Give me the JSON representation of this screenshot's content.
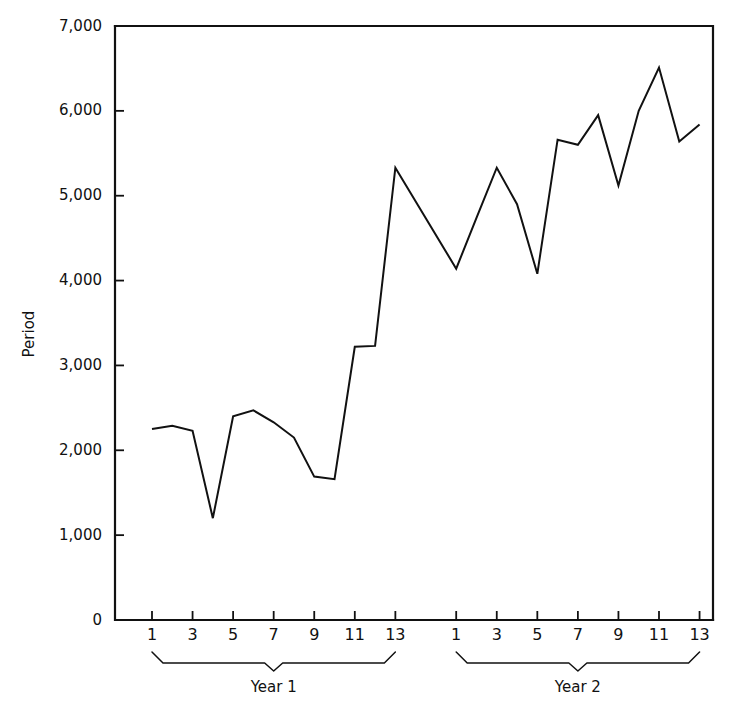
{
  "chart_data": {
    "type": "line",
    "title": "",
    "xlabel": "",
    "ylabel": "Period",
    "ylim": [
      0,
      7000
    ],
    "ytick_labels": [
      "7,000",
      "6,000",
      "5,000",
      "4,000",
      "3,000",
      "2,000",
      "1,000",
      "0"
    ],
    "ytick_values": [
      7000,
      6000,
      5000,
      4000,
      3000,
      2000,
      1000,
      0
    ],
    "grid": false,
    "legend": "none",
    "xtick_labels": [
      "1",
      "3",
      "5",
      "7",
      "9",
      "11",
      "13"
    ],
    "xtick_values": [
      1,
      3,
      5,
      7,
      9,
      11,
      13
    ],
    "groups": [
      {
        "label": "Year 1",
        "x": [
          1,
          2,
          3,
          4,
          5,
          6,
          7,
          8,
          9,
          10,
          11,
          12,
          13
        ],
        "values": [
          2250,
          2290,
          2230,
          1200,
          2400,
          2470,
          2330,
          2150,
          1690,
          1660,
          3220,
          3230,
          5330
        ]
      },
      {
        "label": "Year 2",
        "x": [
          1,
          2,
          3,
          4,
          5,
          6,
          7,
          8,
          9,
          10,
          11,
          12,
          13
        ],
        "values": [
          4140,
          4740,
          5330,
          4900,
          4080,
          5660,
          5600,
          5950,
          5120,
          6000,
          6510,
          5640,
          5840
        ]
      }
    ]
  },
  "axis": {
    "y_title": "Period"
  }
}
